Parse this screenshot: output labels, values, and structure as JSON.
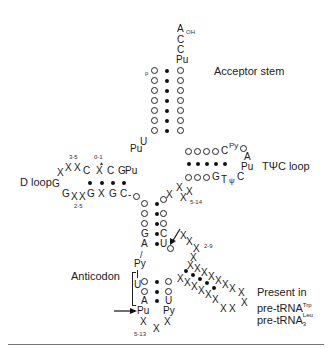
{
  "labels": {
    "acceptor_stem": "Acceptor stem",
    "d_loop": "D loop",
    "tpsic_loop": "TΨC loop",
    "anticodon": "Anticodon",
    "present_in": "Present in",
    "pre_trna_trp": "pre-tRNA",
    "pre_trna_trp_sup": "Trp",
    "pre_trna_leu": "pre-tRNA",
    "pre_trna_leu_sup": "Leu",
    "pre_trna_leu_sub": "3"
  },
  "acceptor_end": {
    "a": "A",
    "oh": "OH",
    "c1": "C",
    "c2": "C",
    "pu": "Pu",
    "p": "p",
    "u": "U",
    "pu_left": "Pu"
  },
  "d_arm": {
    "top": [
      "X",
      "X",
      "X",
      "C",
      "X",
      "C",
      "G",
      "Pu"
    ],
    "bottom": [
      "G",
      "X",
      "X",
      "G",
      "X",
      "G",
      "C"
    ],
    "loop_x": "X",
    "loop_g": "G",
    "range_top": "3-5",
    "range_mid": "0-1",
    "range_bottom": "2-5"
  },
  "t_arm": {
    "top_end": [
      "C",
      "Py"
    ],
    "bottom_end": [
      "G",
      "T",
      "ψ",
      "C"
    ],
    "loop": [
      "A",
      "Pu"
    ],
    "variable_range": "5-14"
  },
  "anticodon_arm": {
    "stem_left": [
      "G",
      "A"
    ],
    "stem_right": [
      "C",
      "U"
    ],
    "py": "Py",
    "u": "U",
    "anticodon_bottom_left": "A",
    "anticodon_bottom_right": "U",
    "pu": "Pu",
    "py_right": "Py",
    "loop_range": "5-13",
    "intron_range": "2-9"
  }
}
